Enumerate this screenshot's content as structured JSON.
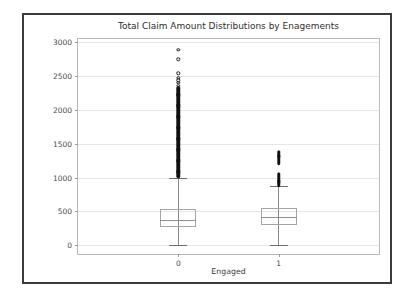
{
  "figure": {
    "title": "Total Claim Amount Distributions by Enagements",
    "xlabel": "Engaged",
    "ylabel": "Total Claim Amount",
    "background": "#ffffff",
    "frame_color": "#3b3b3b",
    "grid_color": "#e6e6e6",
    "marker_color": "#111111"
  },
  "chart_data": {
    "type": "box",
    "title": "Total Claim Amount Distributions by Enagements",
    "xlabel": "Engaged",
    "ylabel": "Total Claim Amount",
    "ylim": [
      -130,
      3050
    ],
    "yticks": [
      0,
      500,
      1000,
      1500,
      2000,
      2500,
      3000
    ],
    "ytick_labels": [
      "0",
      "500",
      "1000",
      "1500",
      "2000",
      "2500",
      "3000"
    ],
    "xticks": [
      0,
      1
    ],
    "categories": [
      "0",
      "1"
    ],
    "grid": true,
    "legend": null,
    "boxes": [
      {
        "category": "0",
        "whisker_low": 0,
        "q1": 275,
        "median": 370,
        "q3": 530,
        "whisker_high": 1000,
        "outlier_range": [
          1000,
          2890
        ],
        "outlier_note": "dense continuous column of fliers from ~1000 to ~2330, sparse circles above",
        "isolated_outliers": [
          2890,
          2750,
          2540,
          2480,
          2440,
          2400,
          2360,
          2330
        ]
      },
      {
        "category": "1",
        "whisker_low": 5,
        "q1": 300,
        "median": 420,
        "q3": 545,
        "whisker_high": 870,
        "outlier_range": [
          870,
          1380
        ],
        "outlier_note": "two clusters: ~870-1060 and ~1190-1380",
        "isolated_outliers": [
          1380,
          1350,
          1320,
          1290,
          1260,
          1230,
          1200,
          1060,
          1030,
          1000,
          960,
          930,
          900,
          875
        ]
      }
    ]
  }
}
